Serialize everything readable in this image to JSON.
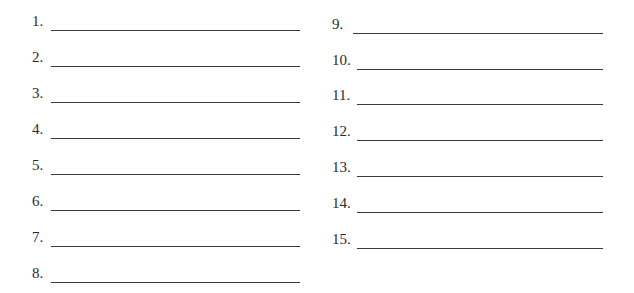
{
  "worksheet": {
    "left_column": [
      {
        "number": "1.",
        "answer": ""
      },
      {
        "number": "2.",
        "answer": ""
      },
      {
        "number": "3.",
        "answer": ""
      },
      {
        "number": "4.",
        "answer": ""
      },
      {
        "number": "5.",
        "answer": ""
      },
      {
        "number": "6.",
        "answer": ""
      },
      {
        "number": "7.",
        "answer": ""
      },
      {
        "number": "8.",
        "answer": ""
      }
    ],
    "right_column": [
      {
        "number": "9.",
        "answer": ""
      },
      {
        "number": "10.",
        "answer": ""
      },
      {
        "number": "11.",
        "answer": ""
      },
      {
        "number": "12.",
        "answer": ""
      },
      {
        "number": "13.",
        "answer": ""
      },
      {
        "number": "14.",
        "answer": ""
      },
      {
        "number": "15.",
        "answer": ""
      }
    ]
  }
}
